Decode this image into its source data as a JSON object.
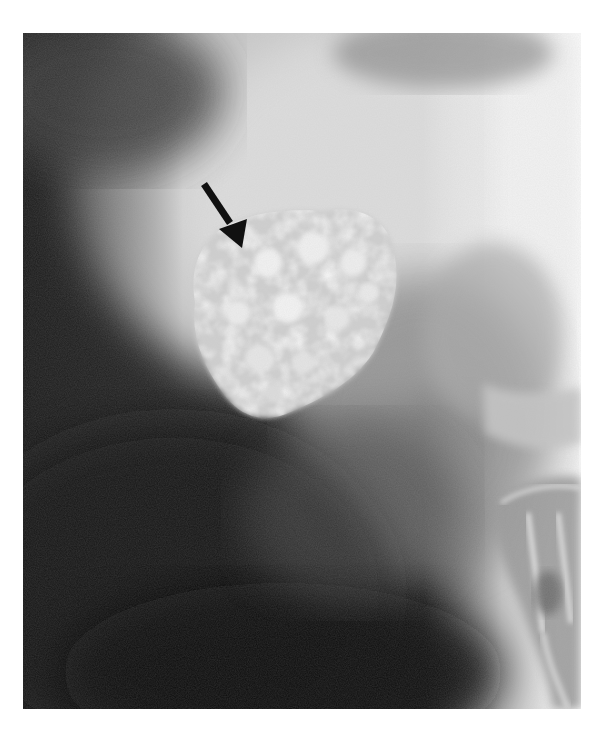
{
  "figure": {
    "kind": "radiograph",
    "modality": "X-ray",
    "annotation": {
      "type": "arrow",
      "color": "#1a1a1a",
      "points_to": "calcified-mass"
    },
    "regions": [
      {
        "name": "calcified-mass",
        "appearance": "bright lobulated opacity"
      },
      {
        "name": "spine-bone",
        "appearance": "bright bony structures at right lower edge"
      },
      {
        "name": "soft-tissue-shadow",
        "appearance": "diffuse gray haze"
      }
    ],
    "colors": {
      "background": "#ffffff",
      "dark_field": "#1c1c1c",
      "mid_gray": "#7a7a7a",
      "bright": "#f4f4f4"
    }
  }
}
